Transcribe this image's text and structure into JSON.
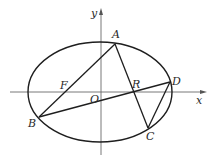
{
  "diagram": {
    "type": "geometry",
    "axes": {
      "x_label": "x",
      "y_label": "y",
      "origin_label": "O",
      "x_axis": {
        "x1": 10,
        "x2": 203,
        "y": 92
      },
      "y_axis": {
        "x": 101,
        "y1": 155,
        "y2": 12
      }
    },
    "ellipse": {
      "cx": 100,
      "cy": 92,
      "rx": 72,
      "ry": 50
    },
    "points": [
      {
        "name": "A",
        "x": 115,
        "y": 44,
        "lx": 112,
        "ly": 38
      },
      {
        "name": "B",
        "x": 39,
        "y": 117,
        "lx": 28,
        "ly": 127
      },
      {
        "name": "C",
        "x": 148,
        "y": 128,
        "lx": 146,
        "ly": 140
      },
      {
        "name": "D",
        "x": 170,
        "y": 82,
        "lx": 172,
        "ly": 85
      },
      {
        "name": "F",
        "x": 67,
        "y": 92,
        "lx": 60,
        "ly": 89
      },
      {
        "name": "R",
        "x": 133,
        "y": 92,
        "lx": 132,
        "ly": 88
      },
      {
        "name": "O",
        "x": 101,
        "y": 92,
        "lx": 90,
        "ly": 103
      }
    ],
    "segments": [
      {
        "from": "A",
        "to": "B"
      },
      {
        "from": "A",
        "to": "C"
      },
      {
        "from": "B",
        "to": "D"
      },
      {
        "from": "C",
        "to": "D"
      }
    ],
    "colors": {
      "line": "#1e1e1e",
      "axis": "#6a6a6a",
      "label": "#2a2a2a",
      "background": "#ffffff"
    }
  }
}
